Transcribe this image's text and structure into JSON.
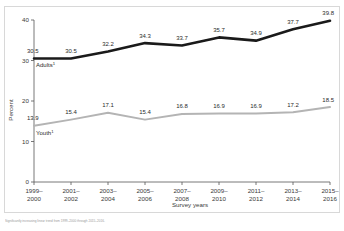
{
  "footnote": {
    "text": "Significantly increasing linear trend from 1999–2000 through 2015–2016."
  },
  "chart_data": {
    "type": "line",
    "title": "",
    "xlabel": "Survey years",
    "ylabel": "Percent",
    "categories": [
      "1999–2000",
      "2001–2002",
      "2003–2004",
      "2005–2006",
      "2007–2008",
      "2009–2010",
      "2011–2012",
      "2013–2014",
      "2015–2016"
    ],
    "category_lines": [
      [
        "1999–",
        "2000"
      ],
      [
        "2001–",
        "2002"
      ],
      [
        "2003–",
        "2004"
      ],
      [
        "2005–",
        "2006"
      ],
      [
        "2007–",
        "2008"
      ],
      [
        "2009–",
        "2010"
      ],
      [
        "2011–",
        "2012"
      ],
      [
        "2013–",
        "2014"
      ],
      [
        "2015–",
        "2016"
      ]
    ],
    "ylim": [
      0,
      40
    ],
    "yticks": [
      0,
      10,
      20,
      30,
      40
    ],
    "ytick_labels": [
      "0",
      "10",
      "20",
      "30",
      "40"
    ],
    "grid": false,
    "legend": "inline-labels",
    "series": [
      {
        "name": "Adults",
        "label_text": "Adults",
        "label_superscript": "1",
        "color": "#1a1a1a",
        "width": 2.6,
        "values": [
          30.5,
          30.5,
          32.2,
          34.3,
          33.7,
          35.7,
          34.9,
          37.7,
          39.8
        ],
        "value_labels": [
          "30.5",
          "30.5",
          "32.2",
          "34.3",
          "33.7",
          "35.7",
          "34.9",
          "37.7",
          "39.8"
        ]
      },
      {
        "name": "Youth",
        "label_text": "Youth",
        "label_superscript": "1",
        "color": "#b4b4b4",
        "width": 2.0,
        "values": [
          13.9,
          15.4,
          17.1,
          15.4,
          16.8,
          16.9,
          16.9,
          17.2,
          18.5
        ],
        "value_labels": [
          "13.9",
          "15.4",
          "17.1",
          "15.4",
          "16.8",
          "16.9",
          "16.9",
          "17.2",
          "18.5"
        ]
      }
    ]
  }
}
